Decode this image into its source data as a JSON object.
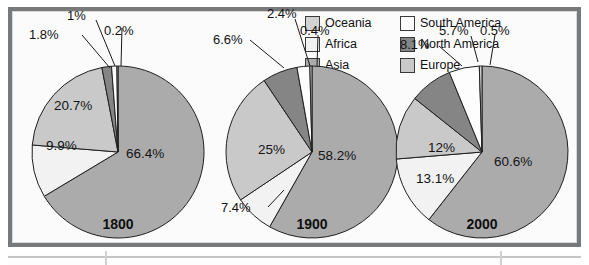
{
  "figure": {
    "legend": {
      "position": "top-right",
      "entries": [
        {
          "label": "Oceania",
          "color": "#d2d2d2"
        },
        {
          "label": "South America",
          "color": "#fdfdfd"
        },
        {
          "label": "Africa",
          "color": "#f2f2f2"
        },
        {
          "label": "North America",
          "color": "#858585"
        },
        {
          "label": "Asia",
          "color": "#ababab"
        },
        {
          "label": "Europe",
          "color": "#c9c9c9"
        }
      ]
    }
  },
  "chart_data": [
    {
      "type": "pie",
      "title": "1800",
      "labels": [
        "Asia",
        "Africa",
        "Europe",
        "North America",
        "South America",
        "Oceania"
      ],
      "values": [
        66.4,
        9.9,
        20.7,
        1.8,
        1.0,
        0.2
      ],
      "display_values": [
        "66.4%",
        "9.9%",
        "20.7%",
        "1.8%",
        "1%",
        "0.2%"
      ],
      "colors": [
        "#ababab",
        "#f2f2f2",
        "#c9c9c9",
        "#858585",
        "#fdfdfd",
        "#d2d2d2"
      ],
      "units": "percent"
    },
    {
      "type": "pie",
      "title": "1900",
      "labels": [
        "Asia",
        "Africa",
        "Europe",
        "North America",
        "South America",
        "Oceania"
      ],
      "values": [
        58.2,
        7.4,
        25.0,
        6.6,
        2.4,
        0.4
      ],
      "display_values": [
        "58.2%",
        "7.4%",
        "25%",
        "6.6%",
        "2.4%",
        "0.4%"
      ],
      "colors": [
        "#ababab",
        "#f2f2f2",
        "#c9c9c9",
        "#858585",
        "#fdfdfd",
        "#d2d2d2"
      ],
      "units": "percent"
    },
    {
      "type": "pie",
      "title": "2000",
      "labels": [
        "Asia",
        "Africa",
        "Europe",
        "North America",
        "South America",
        "Oceania"
      ],
      "values": [
        60.6,
        13.1,
        12.0,
        8.1,
        5.7,
        0.5
      ],
      "display_values": [
        "60.6%",
        "13.1%",
        "12%",
        "8.1%",
        "5.7%",
        "0.5%"
      ],
      "colors": [
        "#ababab",
        "#f2f2f2",
        "#c9c9c9",
        "#858585",
        "#fdfdfd",
        "#d2d2d2"
      ],
      "units": "percent"
    }
  ]
}
